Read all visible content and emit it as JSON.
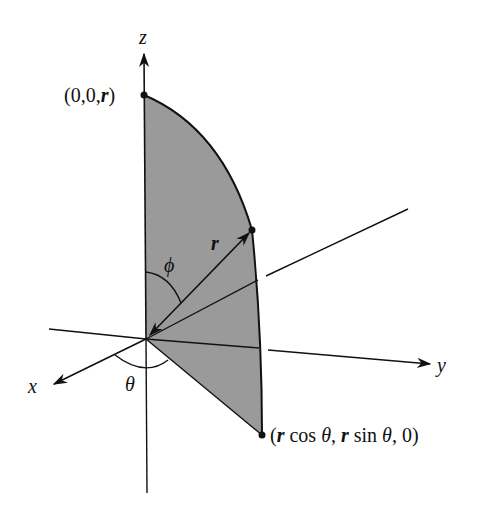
{
  "figure": {
    "axes": {
      "x_label": "x",
      "y_label": "y",
      "z_label": "z"
    },
    "points": {
      "top": {
        "label_open": "(0,0,",
        "label_var": "r",
        "label_close": ")"
      },
      "bottom": {
        "label_parts": [
          "(",
          "r",
          " cos ",
          "θ",
          ", ",
          "r",
          " sin ",
          "θ",
          ", 0)"
        ]
      },
      "mid": {
        "description": "point on arc at distance r"
      }
    },
    "labels": {
      "radius": "r",
      "polar_angle": "ϕ",
      "azimuth_angle": "θ"
    },
    "colors": {
      "shade": "#9a9a9a",
      "ink": "#111111",
      "background": "#ffffff"
    }
  }
}
